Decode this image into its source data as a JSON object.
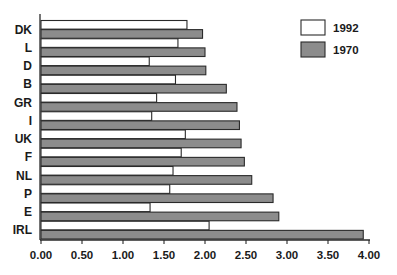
{
  "chart_data": {
    "type": "bar",
    "orientation": "horizontal",
    "title": "",
    "xlabel": "",
    "ylabel": "",
    "xlim": [
      0,
      4.0
    ],
    "x_ticks": [
      "0.00",
      "0.50",
      "1.00",
      "1.50",
      "2.00",
      "2.50",
      "3.00",
      "3.50",
      "4.00"
    ],
    "categories": [
      "DK",
      "L",
      "D",
      "B",
      "GR",
      "I",
      "UK",
      "F",
      "NL",
      "P",
      "E",
      "IRL"
    ],
    "series": [
      {
        "name": "1992",
        "color": "#ffffff",
        "values": [
          1.78,
          1.67,
          1.32,
          1.64,
          1.41,
          1.35,
          1.76,
          1.71,
          1.61,
          1.57,
          1.33,
          2.05
        ]
      },
      {
        "name": "1970",
        "color": "#8c8c8c",
        "values": [
          1.97,
          2.0,
          2.01,
          2.26,
          2.39,
          2.42,
          2.44,
          2.48,
          2.57,
          2.83,
          2.9,
          3.93
        ]
      }
    ],
    "legend": {
      "position": "upper right",
      "entries": [
        "1992",
        "1970"
      ]
    },
    "grid": false
  }
}
